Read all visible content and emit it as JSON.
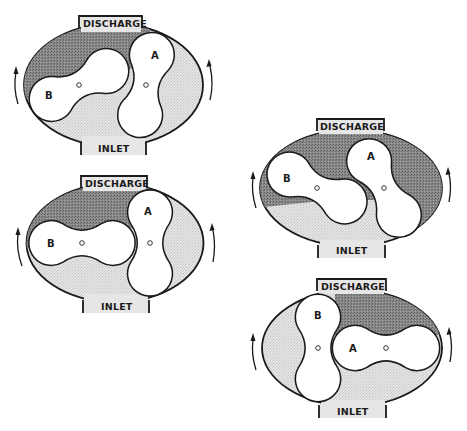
{
  "figure": {
    "diagrams": [
      {
        "id": "stage-1",
        "discharge_label": "DISCHARGE",
        "inlet_label": "INLET",
        "rotor_a_label": "A",
        "rotor_b_label": "B",
        "rotation_arrows": [
          "up-left",
          "up-right"
        ]
      },
      {
        "id": "stage-2",
        "discharge_label": "DISCHARGE",
        "inlet_label": "INLET",
        "rotor_a_label": "A",
        "rotor_b_label": "B",
        "rotation_arrows": [
          "up-left",
          "up-right"
        ]
      },
      {
        "id": "stage-3",
        "discharge_label": "DISCHARGE",
        "inlet_label": "INLET",
        "rotor_a_label": "A",
        "rotor_b_label": "B",
        "rotation_arrows": [
          "up-left",
          "up-right"
        ]
      },
      {
        "id": "stage-4",
        "discharge_label": "DISCHARGE",
        "inlet_label": "INLET",
        "rotor_a_label": "A",
        "rotor_b_label": "B",
        "rotation_arrows": [
          "up-left",
          "up-right"
        ]
      }
    ],
    "colors": {
      "outline": "#1a1a1a",
      "discharge_pocket": "#7a7a7a",
      "inlet_pocket": "#dcdcdc",
      "rotor_fill": "#ffffff"
    }
  }
}
